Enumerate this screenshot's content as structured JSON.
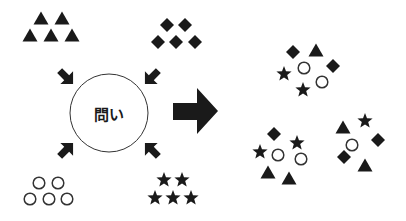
{
  "diagram": {
    "center": {
      "label": "問い",
      "cx": 109,
      "cy": 113,
      "r": 39
    },
    "colors": {
      "fill": "#1a1a1a",
      "stroke": "#333333",
      "background": "#ffffff"
    },
    "input_groups": [
      {
        "name": "triangles",
        "shape": "triangle",
        "items": [
          [
            41,
            18
          ],
          [
            62,
            18
          ],
          [
            30,
            35
          ],
          [
            51,
            35
          ],
          [
            72,
            35
          ]
        ]
      },
      {
        "name": "diamonds",
        "shape": "diamond",
        "items": [
          [
            167,
            25
          ],
          [
            185,
            25
          ],
          [
            158,
            42
          ],
          [
            176,
            42
          ],
          [
            195,
            42
          ]
        ]
      },
      {
        "name": "circles",
        "shape": "circle",
        "items": [
          [
            39,
            183
          ],
          [
            58,
            183
          ],
          [
            30,
            199
          ],
          [
            49,
            199
          ],
          [
            67,
            199
          ]
        ]
      },
      {
        "name": "stars",
        "shape": "star",
        "items": [
          [
            164,
            180
          ],
          [
            182,
            180
          ],
          [
            155,
            198
          ],
          [
            173,
            198
          ],
          [
            191,
            198
          ]
        ]
      }
    ],
    "output_groups": [
      {
        "name": "mixed-group-1",
        "items": [
          {
            "shape": "diamond",
            "x": 293,
            "y": 52
          },
          {
            "shape": "triangle",
            "x": 316,
            "y": 50
          },
          {
            "shape": "diamond",
            "x": 333,
            "y": 66
          },
          {
            "shape": "star",
            "x": 284,
            "y": 74
          },
          {
            "shape": "circle",
            "x": 304,
            "y": 68
          },
          {
            "shape": "star",
            "x": 303,
            "y": 90
          },
          {
            "shape": "circle",
            "x": 322,
            "y": 82
          }
        ]
      },
      {
        "name": "mixed-group-2",
        "items": [
          {
            "shape": "diamond",
            "x": 274,
            "y": 134
          },
          {
            "shape": "star",
            "x": 297,
            "y": 143
          },
          {
            "shape": "star",
            "x": 260,
            "y": 152
          },
          {
            "shape": "circle",
            "x": 278,
            "y": 155
          },
          {
            "shape": "circle",
            "x": 301,
            "y": 159
          },
          {
            "shape": "triangle",
            "x": 268,
            "y": 172
          },
          {
            "shape": "triangle",
            "x": 289,
            "y": 178
          }
        ]
      },
      {
        "name": "mixed-group-3",
        "items": [
          {
            "shape": "triangle",
            "x": 343,
            "y": 127
          },
          {
            "shape": "star",
            "x": 365,
            "y": 121
          },
          {
            "shape": "diamond",
            "x": 378,
            "y": 140
          },
          {
            "shape": "circle",
            "x": 352,
            "y": 145
          },
          {
            "shape": "diamond",
            "x": 344,
            "y": 157
          },
          {
            "shape": "triangle",
            "x": 365,
            "y": 165
          }
        ]
      }
    ],
    "small_arrows": [
      {
        "name": "arrow-from-triangles",
        "x": 66,
        "y": 77,
        "angle": 45
      },
      {
        "name": "arrow-from-diamonds",
        "x": 152,
        "y": 77,
        "angle": 135
      },
      {
        "name": "arrow-from-circles",
        "x": 66,
        "y": 150,
        "angle": -45
      },
      {
        "name": "arrow-from-stars",
        "x": 152,
        "y": 150,
        "angle": -135
      }
    ],
    "big_arrow": {
      "name": "result-arrow",
      "shaft_x1": 173,
      "shaft_x2": 197,
      "shaft_y1": 103,
      "shaft_y2": 120,
      "head_x": 218,
      "head_y1": 88,
      "head_y2": 134
    }
  }
}
